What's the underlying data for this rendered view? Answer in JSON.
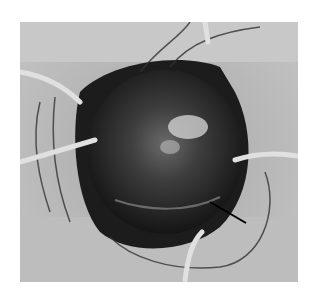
{
  "figure": {
    "arrow_annotation": true,
    "colors": {
      "background": "#ffffff",
      "drape": "#b9b9b9",
      "mass": "#2a2a2a"
    }
  }
}
